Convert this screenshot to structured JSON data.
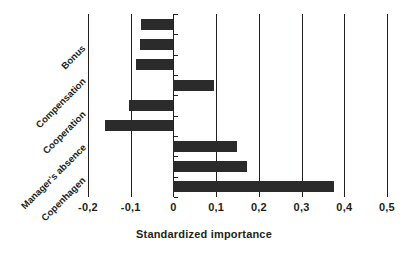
{
  "chart_data": {
    "type": "bar",
    "orientation": "horizontal",
    "title": "",
    "xlabel": "Standardized importance",
    "ylabel": "",
    "xlim": [
      -0.2,
      0.5
    ],
    "grid": true,
    "legend": null,
    "decimal_separator": ",",
    "bar_color": "#2b2b2b",
    "axis_color": "#231f20",
    "xticks": [
      -0.2,
      -0.1,
      0,
      0.1,
      0.2,
      0.3,
      0.4,
      0.5
    ],
    "xtick_labels": [
      "-0,2",
      "-0,1",
      "0",
      "0,1",
      "0,2",
      "0,3",
      "0,4",
      "0,5"
    ],
    "category_labels": [
      "Bonus",
      "Compensation",
      "Cooperation",
      "Manager's absence",
      "Copenhagen"
    ],
    "bars": [
      {
        "index": 0,
        "value": -0.075
      },
      {
        "index": 1,
        "value": -0.078
      },
      {
        "index": 2,
        "value": -0.088
      },
      {
        "index": 3,
        "value": 0.095
      },
      {
        "index": 4,
        "value": -0.105
      },
      {
        "index": 5,
        "value": -0.16
      },
      {
        "index": 6,
        "value": 0.148
      },
      {
        "index": 7,
        "value": 0.172
      },
      {
        "index": 8,
        "value": 0.375
      }
    ],
    "values": [
      -0.075,
      -0.078,
      -0.088,
      0.095,
      -0.105,
      -0.16,
      0.148,
      0.172,
      0.375
    ]
  }
}
